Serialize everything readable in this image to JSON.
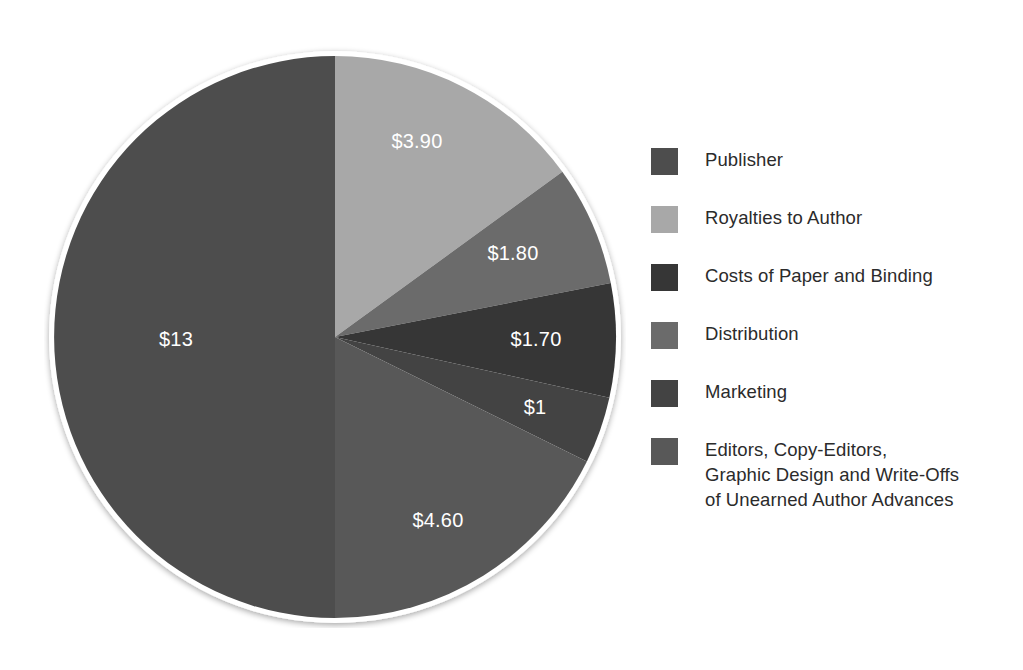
{
  "chart_data": {
    "type": "pie",
    "title": "",
    "subtitle": "",
    "xlabel": "",
    "ylabel": "",
    "value_prefix": "$",
    "total": 26,
    "units": "dollars",
    "legend_position": "right",
    "grid": false,
    "start_angle_deg": 0,
    "direction": "clockwise",
    "categories": [
      "Publisher",
      "Royalties to Author",
      "Costs of Paper and Binding",
      "Distribution",
      "Marketing",
      "Editors, Copy-Editors,\nGraphic Design and Write-Offs\nof Unearned Author Advances"
    ],
    "values": [
      13,
      3.9,
      1.7,
      1.8,
      1,
      4.6
    ],
    "labels": [
      "$13",
      "$3.90",
      "$1.70",
      "$1.80",
      "$1",
      "$4.60"
    ],
    "colors": [
      "#4d4d4d",
      "#a8a8a8",
      "#363636",
      "#6b6b6b",
      "#434343",
      "#585858"
    ],
    "slices": [
      {
        "name": "Royalties to Author",
        "value": 3.9,
        "label": "$3.90",
        "color": "#a8a8a8",
        "start_deg": 0,
        "sweep_deg": 54,
        "label_x": 417,
        "label_y": 143
      },
      {
        "name": "Distribution",
        "value": 1.8,
        "label": "$1.80",
        "color": "#6b6b6b",
        "start_deg": 54,
        "sweep_deg": 24.92,
        "label_x": 513,
        "label_y": 255
      },
      {
        "name": "Costs of Paper and Binding",
        "value": 1.7,
        "label": "$1.70",
        "color": "#363636",
        "start_deg": 78.92,
        "sweep_deg": 23.54,
        "label_x": 536,
        "label_y": 341
      },
      {
        "name": "Marketing",
        "value": 1,
        "label": "$1",
        "color": "#434343",
        "start_deg": 102.46,
        "sweep_deg": 13.85,
        "label_x": 535,
        "label_y": 409
      },
      {
        "name": "Editors, Copy-Editors, Graphic Design and Write-Offs of Unearned Author Advances",
        "value": 4.6,
        "label": "$4.60",
        "color": "#585858",
        "start_deg": 116.31,
        "sweep_deg": 63.69,
        "label_x": 438,
        "label_y": 522
      },
      {
        "name": "Publisher",
        "value": 13,
        "label": "$13",
        "color": "#4d4d4d",
        "start_deg": 180,
        "sweep_deg": 180,
        "label_x": 176,
        "label_y": 341
      }
    ]
  },
  "legend": {
    "items": [
      {
        "label": "Publisher",
        "color": "#4d4d4d"
      },
      {
        "label": "Royalties to Author",
        "color": "#a8a8a8"
      },
      {
        "label": "Costs of Paper and Binding",
        "color": "#363636"
      },
      {
        "label": "Distribution",
        "color": "#6b6b6b"
      },
      {
        "label": "Marketing",
        "color": "#434343"
      },
      {
        "label": "Editors, Copy-Editors,\nGraphic Design and Write-Offs\nof Unearned Author Advances",
        "color": "#585858"
      }
    ]
  },
  "geometry": {
    "center_x": 291,
    "center_y": 291,
    "radius": 281,
    "rim_color": "#ffffff",
    "background": "#ffffff"
  }
}
